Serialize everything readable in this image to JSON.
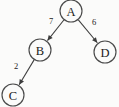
{
  "graph": {
    "type": "directed-weighted-graph",
    "canvas": {
      "width": 119,
      "height": 107,
      "background": "#fbfbfa"
    },
    "node_style": {
      "radius": 11,
      "stroke": "#4a4a4a",
      "fill": "#fbfbfa",
      "text_color": "#1b1b1b"
    },
    "edge_style": {
      "stroke": "#3c3c3c",
      "label_color": "#232323",
      "directed": true
    },
    "nodes": [
      {
        "id": "A",
        "label": "A",
        "cx": 71,
        "cy": 11,
        "r": 11
      },
      {
        "id": "B",
        "label": "B",
        "cx": 40,
        "cy": 50,
        "r": 11
      },
      {
        "id": "C",
        "label": "C",
        "cx": 13,
        "cy": 95,
        "r": 11
      },
      {
        "id": "D",
        "label": "D",
        "cx": 105,
        "cy": 52,
        "r": 11
      }
    ],
    "edges": [
      {
        "id": "edge-a-b",
        "from": "A",
        "to": "B",
        "weight": "7",
        "label_x": 51,
        "label_y": 21
      },
      {
        "id": "edge-a-d",
        "from": "A",
        "to": "D",
        "weight": "6",
        "label_x": 94,
        "label_y": 22
      },
      {
        "id": "edge-b-c",
        "from": "B",
        "to": "C",
        "weight": "2",
        "label_x": 16,
        "label_y": 66
      }
    ]
  }
}
